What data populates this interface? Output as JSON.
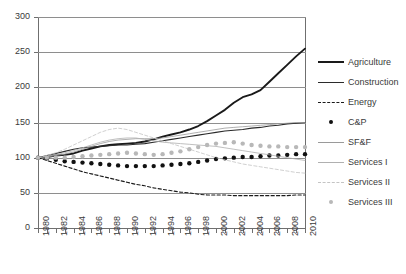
{
  "chart_data": {
    "type": "line",
    "title": "",
    "subtitle": "",
    "xlabel": "",
    "ylabel": "",
    "xlim": [
      1980,
      2010
    ],
    "ylim": [
      0,
      300
    ],
    "yticks": [
      0,
      50,
      100,
      150,
      200,
      250,
      300
    ],
    "xticks": [
      1980,
      1982,
      1984,
      1986,
      1988,
      1990,
      1992,
      1994,
      1996,
      1998,
      2000,
      2002,
      2004,
      2006,
      2008,
      2010
    ],
    "xticks_minor": [
      1981,
      1983,
      1985,
      1987,
      1989,
      1991,
      1993,
      1995,
      1997,
      1999,
      2001,
      2003,
      2005,
      2007,
      2009
    ],
    "grid": "horizontal",
    "legend_position": "right",
    "index_base": 100,
    "x": [
      1980,
      1981,
      1982,
      1983,
      1984,
      1985,
      1986,
      1987,
      1988,
      1989,
      1990,
      1991,
      1992,
      1993,
      1994,
      1995,
      1996,
      1997,
      1998,
      1999,
      2000,
      2001,
      2002,
      2003,
      2004,
      2005,
      2006,
      2007,
      2008,
      2009,
      2010
    ],
    "series": [
      {
        "name": "Agriculture",
        "style": "solid",
        "width": 1.9,
        "color": "#1a1a1a",
        "marker": "none",
        "values": [
          100,
          101,
          103,
          104,
          106,
          110,
          113,
          116,
          118,
          119,
          120,
          121,
          123,
          126,
          130,
          133,
          136,
          140,
          145,
          152,
          160,
          168,
          178,
          186,
          190,
          196,
          208,
          220,
          232,
          244,
          255
        ]
      },
      {
        "name": "Construction",
        "style": "solid",
        "width": 1.1,
        "color": "#2b2b2b",
        "marker": "none",
        "values": [
          100,
          103,
          106,
          109,
          112,
          114,
          115,
          116,
          117,
          118,
          118,
          119,
          120,
          122,
          124,
          126,
          128,
          130,
          132,
          134,
          136,
          138,
          139,
          140,
          142,
          143,
          145,
          146,
          148,
          149,
          150
        ]
      },
      {
        "name": "Energy",
        "style": "dashed",
        "width": 1.1,
        "color": "#1a1a1a",
        "marker": "none",
        "values": [
          100,
          96,
          92,
          88,
          84,
          80,
          77,
          74,
          71,
          68,
          65,
          62,
          60,
          57,
          55,
          53,
          51,
          50,
          48,
          47,
          47,
          47,
          46,
          46,
          46,
          46,
          46,
          46,
          46,
          47,
          47
        ]
      },
      {
        "name": "C&P",
        "style": "dotted-markers",
        "width": 0,
        "color": "#111111",
        "marker": "circle",
        "marker_size": 4.4,
        "values": [
          100,
          99,
          97,
          95,
          94,
          93,
          92,
          91,
          90,
          89,
          88,
          88,
          88,
          88,
          89,
          90,
          91,
          92,
          94,
          96,
          98,
          99,
          100,
          101,
          101,
          102,
          103,
          103,
          104,
          105,
          105
        ]
      },
      {
        "name": "SF&F",
        "style": "solid",
        "width": 0.8,
        "color": "#9a9a9a",
        "marker": "none",
        "values": [
          100,
          101,
          103,
          105,
          108,
          112,
          116,
          120,
          123,
          125,
          126,
          127,
          127,
          127,
          128,
          130,
          132,
          134,
          136,
          138,
          140,
          142,
          143,
          144,
          145,
          146,
          147,
          148,
          149,
          150,
          150
        ]
      },
      {
        "name": "Services I",
        "style": "solid",
        "width": 0.8,
        "color": "#b0b0b0",
        "marker": "none",
        "values": [
          100,
          102,
          104,
          107,
          110,
          114,
          118,
          122,
          125,
          127,
          128,
          128,
          126,
          124,
          122,
          121,
          120,
          119,
          118,
          117,
          116,
          114,
          112,
          110,
          108,
          106,
          104,
          102,
          100,
          98,
          96
        ]
      },
      {
        "name": "Services II",
        "style": "dashed",
        "width": 0.8,
        "color": "#c4c4c4",
        "marker": "none",
        "values": [
          100,
          103,
          107,
          112,
          118,
          124,
          130,
          136,
          140,
          142,
          140,
          136,
          132,
          128,
          124,
          120,
          116,
          112,
          108,
          104,
          100,
          97,
          94,
          91,
          89,
          87,
          85,
          83,
          81,
          79,
          78
        ]
      },
      {
        "name": "Services III",
        "style": "dotted-markers",
        "width": 0,
        "color": "#b8b8b8",
        "marker": "circle",
        "marker_size": 4.4,
        "values": [
          100,
          100,
          100,
          100,
          101,
          102,
          103,
          104,
          105,
          106,
          107,
          106,
          105,
          104,
          105,
          107,
          109,
          112,
          115,
          118,
          120,
          121,
          122,
          120,
          118,
          117,
          116,
          116,
          115,
          115,
          115
        ]
      }
    ]
  },
  "legend": {
    "items": [
      {
        "label": "Agriculture",
        "swatch": "line-thick-dark"
      },
      {
        "label": "Construction",
        "swatch": "line-medium-dark"
      },
      {
        "label": "Energy",
        "swatch": "line-dashed-dark"
      },
      {
        "label": "C&P",
        "swatch": "dot-dark"
      },
      {
        "label": "SF&F",
        "swatch": "line-thin-gray"
      },
      {
        "label": "Services I",
        "swatch": "line-thin-gray"
      },
      {
        "label": "Services II",
        "swatch": "line-dashed-lightgray"
      },
      {
        "label": "Services III",
        "swatch": "dot-lightgray"
      }
    ]
  },
  "axis": {
    "y_labels": [
      "300",
      "250",
      "200",
      "150",
      "100",
      "50",
      "0"
    ],
    "x_labels": [
      "1980",
      "1982",
      "1984",
      "1986",
      "1988",
      "1990",
      "1992",
      "1994",
      "1996",
      "1998",
      "2000",
      "2002",
      "2004",
      "2006",
      "2008",
      "2010"
    ]
  },
  "colors": {
    "axis": "#6f6f6f",
    "grid": "#8e8e8e",
    "text": "#3a3a3a",
    "dark_series": "#1a1a1a",
    "gray_series": "#9a9a9a",
    "light_series": "#c4c4c4",
    "background": "#ffffff"
  }
}
